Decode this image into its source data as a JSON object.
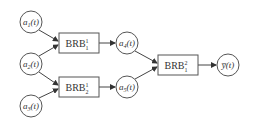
{
  "diagram": {
    "type": "flow",
    "inputs": [
      {
        "id": "a1",
        "label": "a",
        "sub": "1",
        "arg": "(t)",
        "cx": 31,
        "cy": 22
      },
      {
        "id": "a2",
        "label": "a",
        "sub": "2",
        "arg": "(t)",
        "cx": 31,
        "cy": 64
      },
      {
        "id": "a3",
        "label": "a",
        "sub": "3",
        "arg": "(t)",
        "cx": 31,
        "cy": 106
      }
    ],
    "layer1": [
      {
        "id": "brb11",
        "label": "BRB",
        "sup": "1",
        "sub": "1",
        "x": 59,
        "y": 33,
        "w": 40,
        "h": 20
      },
      {
        "id": "brb12",
        "label": "BRB",
        "sup": "1",
        "sub": "2",
        "x": 59,
        "y": 77,
        "w": 40,
        "h": 20
      }
    ],
    "intermediate": [
      {
        "id": "a4",
        "label": "a",
        "sub": "4",
        "arg": "(t)",
        "cx": 127,
        "cy": 43
      },
      {
        "id": "a5",
        "label": "a",
        "sub": "5",
        "arg": "(t)",
        "cx": 127,
        "cy": 87
      }
    ],
    "layer2": [
      {
        "id": "brb21",
        "label": "BRB",
        "sup": "2",
        "sub": "1",
        "x": 158,
        "y": 55,
        "w": 40,
        "h": 20
      }
    ],
    "output": {
      "id": "y",
      "label": "y̅",
      "arg": "(t)",
      "cx": 228,
      "cy": 65
    },
    "edges": [
      {
        "from": "a1",
        "to": "brb11"
      },
      {
        "from": "a2",
        "to": "brb11"
      },
      {
        "from": "a2",
        "to": "brb12"
      },
      {
        "from": "a3",
        "to": "brb12"
      },
      {
        "from": "brb11",
        "to": "a4"
      },
      {
        "from": "brb12",
        "to": "a5"
      },
      {
        "from": "a4",
        "to": "brb21"
      },
      {
        "from": "a5",
        "to": "brb21"
      },
      {
        "from": "brb21",
        "to": "y"
      }
    ]
  }
}
